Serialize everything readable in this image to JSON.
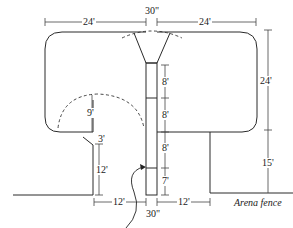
{
  "diagram": {
    "type": "arena roping box and chute layout",
    "colors": {
      "line": "#2a2a2a",
      "dimension": "#444444",
      "background": "#ffffff"
    },
    "dimensions": {
      "top_left_width": "24'",
      "top_center_chute": "30\"",
      "top_right_width": "24'",
      "right_box_depth": "24'",
      "right_lower_depth": "15'",
      "chute_section_1": "8'",
      "chute_section_2": "8'",
      "chute_section_3": "8'",
      "chute_section_4": "7'",
      "left_arc_radius": "9'",
      "left_gap": "3'",
      "left_lower_height": "12'",
      "bottom_left_width": "12'",
      "bottom_center_chute": "30\"",
      "bottom_right_width": "12'"
    },
    "labels": {
      "arena_fence": "Arena fence"
    }
  }
}
